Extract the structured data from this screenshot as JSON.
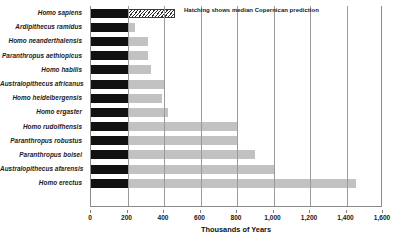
{
  "chart_data": {
    "type": "bar",
    "title": "",
    "xlabel": "Thousands of Years",
    "ylabel": "",
    "xlim": [
      0,
      1600
    ],
    "xticks": [
      0,
      200,
      400,
      600,
      800,
      1000,
      1200,
      1400,
      1600
    ],
    "xticklabels": [
      "0",
      "200",
      "400",
      "600",
      "800",
      "1,000",
      "1,200",
      "1,400",
      "1,600"
    ],
    "grid": true,
    "orientation": "horizontal",
    "annotation": "Hatching shows median Copernican prediction",
    "categories": [
      "Homo sapiens",
      "Ardipithecus ramidus",
      "Homo neanderthalensis",
      "Paranthropus aethiopicus",
      "Homo habilis",
      "Australopithecus africanus",
      "Homo heidelbergensis",
      "Homo ergaster",
      "Homo rudolfhensis",
      "Paranthropus robustus",
      "Paranthropus boisei",
      "Australopithecus afarensis",
      "Homo erectus"
    ],
    "series": [
      {
        "name": "Elapsed duration",
        "style": "solid-black",
        "color": "#111111",
        "values": [
          200,
          200,
          200,
          200,
          200,
          200,
          200,
          200,
          200,
          200,
          200,
          200,
          200
        ]
      },
      {
        "name": "Remaining / total extent",
        "style": "solid-gray",
        "color": "#c2c2c2",
        "values": [
          0,
          240,
          310,
          310,
          330,
          400,
          390,
          420,
          800,
          800,
          900,
          1000,
          1450
        ]
      },
      {
        "name": "Median Copernican prediction",
        "style": "hatched",
        "color": "#ffffff",
        "values": [
          460,
          0,
          0,
          0,
          0,
          0,
          0,
          0,
          0,
          0,
          0,
          0,
          0
        ]
      }
    ]
  },
  "axis_colors": {
    "grid": "#9a9a9a",
    "axis": "#8a8a8a",
    "black_bar": "#111111",
    "gray_bar": "#c2c2c2",
    "background": "#ffffff"
  }
}
